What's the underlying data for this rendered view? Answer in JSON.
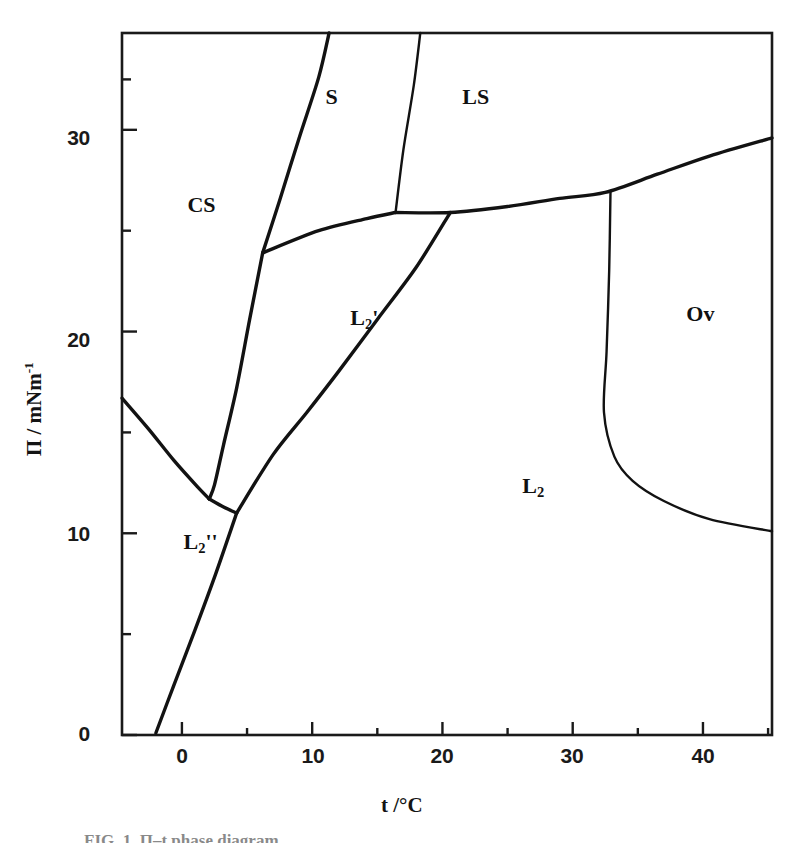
{
  "chart_data": {
    "type": "line",
    "title": "",
    "subtitle": "",
    "xlabel": "t /°C",
    "ylabel": "Π / mNm",
    "ylabel_exponent": "-1",
    "xlim": [
      -4.6,
      45.3
    ],
    "ylim": [
      0,
      34.8
    ],
    "grid": false,
    "legend_position": "none",
    "x_ticks_major": [
      0,
      10,
      20,
      30,
      40
    ],
    "x_tick_labels": [
      "0",
      "10",
      "20",
      "30",
      "40"
    ],
    "x_ticks_minor": [
      5,
      15,
      25,
      35,
      45
    ],
    "y_ticks_major": [
      0,
      10,
      20,
      30
    ],
    "y_tick_labels": [
      "0",
      "10",
      "20",
      "30"
    ],
    "y_ticks_minor": [
      5,
      15,
      25
    ],
    "regions": [
      {
        "name": "CS",
        "label": "CS",
        "sub": "",
        "prime": "",
        "x": 1.5,
        "y": 26.2
      },
      {
        "name": "S",
        "label": "S",
        "sub": "",
        "prime": "",
        "x": 12.1,
        "y": 31.6
      },
      {
        "name": "LS",
        "label": "LS",
        "sub": "",
        "prime": "",
        "x": 22.6,
        "y": 31.6
      },
      {
        "name": "L2prime",
        "label": "L",
        "sub": "2",
        "prime": "'",
        "x": 14.0,
        "y": 20.6
      },
      {
        "name": "L2dprime",
        "label": "L",
        "sub": "2",
        "prime": "''",
        "x": 1.2,
        "y": 9.5
      },
      {
        "name": "L2",
        "label": "L",
        "sub": "2",
        "prime": "",
        "x": 27.2,
        "y": 12.3
      },
      {
        "name": "Ov",
        "label": "Ov",
        "sub": "",
        "prime": "",
        "x": 39.8,
        "y": 20.8
      }
    ],
    "boundaries": [
      {
        "name": "cs-s-upper",
        "description": "CS / S boundary rising from triple point to top frame",
        "points": [
          [
            6.2,
            23.9
          ],
          [
            7.5,
            26.5
          ],
          [
            9.0,
            29.6
          ],
          [
            10.5,
            32.6
          ],
          [
            11.3,
            34.8
          ]
        ]
      },
      {
        "name": "cs-l2prime-lower",
        "description": "CS / L2' boundary descending from triple point toward lower junction",
        "points": [
          [
            6.2,
            23.9
          ],
          [
            5.2,
            20.6
          ],
          [
            4.2,
            17.2
          ],
          [
            3.2,
            14.4
          ],
          [
            2.5,
            12.4
          ],
          [
            2.1,
            11.7
          ]
        ]
      },
      {
        "name": "cs-s-ls-tieline",
        "description": "Near-horizontal CS/S to S/LS tie line",
        "points": [
          [
            6.2,
            23.9
          ],
          [
            10.5,
            25.0
          ],
          [
            14.2,
            25.6
          ],
          [
            16.4,
            25.9
          ]
        ]
      },
      {
        "name": "s-ls",
        "description": "S / LS boundary from tie line junction to top frame",
        "points": [
          [
            16.4,
            25.9
          ],
          [
            17.0,
            29.0
          ],
          [
            17.8,
            32.2
          ],
          [
            18.3,
            34.8
          ]
        ]
      },
      {
        "name": "ls-l2-upper",
        "description": "LS / L2 upper boundary running right, rising to right frame",
        "points": [
          [
            16.4,
            25.9
          ],
          [
            20.6,
            25.9
          ],
          [
            25.0,
            26.2
          ],
          [
            29.0,
            26.6
          ],
          [
            32.5,
            26.9
          ],
          [
            36.5,
            27.8
          ],
          [
            40.5,
            28.7
          ],
          [
            45.3,
            29.6
          ]
        ]
      },
      {
        "name": "l2prime-l2",
        "description": "L2' / L2 boundary from lower triple point up to LS/L2 junction",
        "points": [
          [
            4.2,
            11.0
          ],
          [
            7.0,
            13.9
          ],
          [
            9.6,
            16.0
          ],
          [
            12.0,
            18.0
          ],
          [
            15.0,
            20.6
          ],
          [
            18.0,
            23.2
          ],
          [
            20.6,
            25.9
          ]
        ]
      },
      {
        "name": "l2dprime-cs",
        "description": "L2'' / CS boundary from left frame descending right",
        "points": [
          [
            -4.6,
            16.7
          ],
          [
            -2.6,
            15.2
          ],
          [
            -0.6,
            13.6
          ],
          [
            1.2,
            12.3
          ],
          [
            2.1,
            11.7
          ]
        ]
      },
      {
        "name": "cs-junction-short",
        "description": "Short segment from left junction to lower triple point",
        "points": [
          [
            2.1,
            11.7
          ],
          [
            3.2,
            11.3
          ],
          [
            4.2,
            11.0
          ]
        ]
      },
      {
        "name": "l2dprime-l2",
        "description": "L2'' / L2 boundary descending to x-axis",
        "points": [
          [
            4.2,
            11.0
          ],
          [
            2.6,
            8.0
          ],
          [
            1.0,
            5.2
          ],
          [
            -0.6,
            2.5
          ],
          [
            -2.0,
            0.1
          ]
        ]
      },
      {
        "name": "l2-ov",
        "description": "L2 / Ov boundary, vertical then curving right to frame",
        "points": [
          [
            32.9,
            26.9
          ],
          [
            32.8,
            23.0
          ],
          [
            32.6,
            19.0
          ],
          [
            32.4,
            16.0
          ],
          [
            33.2,
            13.8
          ],
          [
            34.6,
            12.6
          ],
          [
            37.0,
            11.6
          ],
          [
            40.5,
            10.7
          ],
          [
            45.3,
            10.1
          ]
        ]
      }
    ]
  },
  "axes": {
    "x_title": "t /°C",
    "y_title_base": "Π / mNm",
    "y_title_sup": "-1"
  },
  "caption": {
    "text": "FIG. 1.  Π–t phase diagram"
  }
}
